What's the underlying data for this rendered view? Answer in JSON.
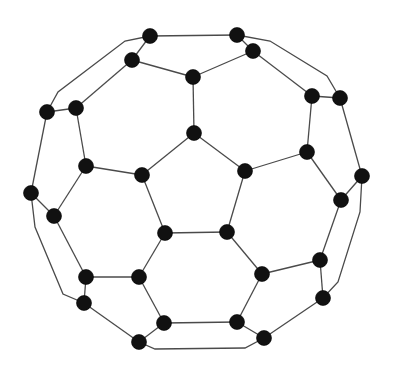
{
  "diagram": {
    "type": "graph",
    "colors": {
      "node": "#111111",
      "edge": "#4a4a4a",
      "background": "#ffffff"
    },
    "node_radius": 7.5,
    "nodes": [
      {
        "id": "n0",
        "x": 150,
        "y": 36
      },
      {
        "id": "n1",
        "x": 237,
        "y": 35
      },
      {
        "id": "n2",
        "x": 132,
        "y": 60
      },
      {
        "id": "n3",
        "x": 253,
        "y": 51
      },
      {
        "id": "n4",
        "x": 193,
        "y": 77
      },
      {
        "id": "n5",
        "x": 47,
        "y": 112
      },
      {
        "id": "n6",
        "x": 76,
        "y": 108
      },
      {
        "id": "n7",
        "x": 312,
        "y": 96
      },
      {
        "id": "n8",
        "x": 340,
        "y": 98
      },
      {
        "id": "n9",
        "x": 194,
        "y": 133
      },
      {
        "id": "n10",
        "x": 86,
        "y": 166
      },
      {
        "id": "n11",
        "x": 142,
        "y": 175
      },
      {
        "id": "n12",
        "x": 245,
        "y": 171
      },
      {
        "id": "n13",
        "x": 307,
        "y": 152
      },
      {
        "id": "n14",
        "x": 31,
        "y": 193
      },
      {
        "id": "n15",
        "x": 54,
        "y": 216
      },
      {
        "id": "n16",
        "x": 362,
        "y": 176
      },
      {
        "id": "n17",
        "x": 341,
        "y": 200
      },
      {
        "id": "n18",
        "x": 165,
        "y": 233
      },
      {
        "id": "n19",
        "x": 227,
        "y": 232
      },
      {
        "id": "n20",
        "x": 320,
        "y": 260
      },
      {
        "id": "n21",
        "x": 86,
        "y": 277
      },
      {
        "id": "n22",
        "x": 139,
        "y": 277
      },
      {
        "id": "n23",
        "x": 262,
        "y": 274
      },
      {
        "id": "n24",
        "x": 84,
        "y": 303
      },
      {
        "id": "n25",
        "x": 323,
        "y": 298
      },
      {
        "id": "n26",
        "x": 164,
        "y": 323
      },
      {
        "id": "n27",
        "x": 237,
        "y": 322
      },
      {
        "id": "n28",
        "x": 139,
        "y": 342
      },
      {
        "id": "n29",
        "x": 264,
        "y": 338
      }
    ],
    "edges": [
      {
        "from": "n0",
        "to": "n1"
      },
      {
        "from": "n0",
        "to": "n2"
      },
      {
        "from": "n1",
        "to": "n3"
      },
      {
        "from": "n2",
        "to": "n4"
      },
      {
        "from": "n3",
        "to": "n4"
      },
      {
        "from": "n4",
        "to": "n9"
      },
      {
        "from": "n2",
        "to": "n6"
      },
      {
        "from": "n5",
        "to": "n6"
      },
      {
        "from": "n6",
        "to": "n10"
      },
      {
        "from": "n3",
        "to": "n7"
      },
      {
        "from": "n7",
        "to": "n8"
      },
      {
        "from": "n7",
        "to": "n13"
      },
      {
        "from": "n9",
        "to": "n11"
      },
      {
        "from": "n9",
        "to": "n12"
      },
      {
        "from": "n11",
        "to": "n18"
      },
      {
        "from": "n12",
        "to": "n19"
      },
      {
        "from": "n18",
        "to": "n19"
      },
      {
        "from": "n10",
        "to": "n11"
      },
      {
        "from": "n12",
        "to": "n13"
      },
      {
        "from": "n10",
        "to": "n15"
      },
      {
        "from": "n13",
        "to": "n17"
      },
      {
        "from": "n5",
        "to": "n14"
      },
      {
        "from": "n14",
        "to": "n15"
      },
      {
        "from": "n8",
        "to": "n16"
      },
      {
        "from": "n16",
        "to": "n17"
      },
      {
        "from": "n15",
        "to": "n21"
      },
      {
        "from": "n17",
        "to": "n20"
      },
      {
        "from": "n18",
        "to": "n22"
      },
      {
        "from": "n19",
        "to": "n23"
      },
      {
        "from": "n21",
        "to": "n22"
      },
      {
        "from": "n23",
        "to": "n20"
      },
      {
        "from": "n21",
        "to": "n24"
      },
      {
        "from": "n20",
        "to": "n25"
      },
      {
        "from": "n22",
        "to": "n26"
      },
      {
        "from": "n23",
        "to": "n27"
      },
      {
        "from": "n26",
        "to": "n27"
      },
      {
        "from": "n24",
        "to": "n28"
      },
      {
        "from": "n26",
        "to": "n28"
      },
      {
        "from": "n27",
        "to": "n29"
      },
      {
        "from": "n25",
        "to": "n29"
      }
    ],
    "outer_paths": [
      {
        "id": "outer-top-left",
        "points": [
          [
            150,
            36
          ],
          [
            125,
            41
          ],
          [
            58,
            92
          ],
          [
            47,
            112
          ]
        ]
      },
      {
        "id": "outer-top-right",
        "points": [
          [
            237,
            35
          ],
          [
            270,
            41
          ],
          [
            327,
            76
          ],
          [
            340,
            98
          ]
        ]
      },
      {
        "id": "outer-left",
        "points": [
          [
            31,
            193
          ],
          [
            35,
            227
          ],
          [
            63,
            294
          ],
          [
            84,
            303
          ]
        ]
      },
      {
        "id": "outer-right",
        "points": [
          [
            362,
            176
          ],
          [
            360,
            212
          ],
          [
            338,
            282
          ],
          [
            323,
            298
          ]
        ]
      },
      {
        "id": "outer-bottom",
        "points": [
          [
            139,
            342
          ],
          [
            155,
            349
          ],
          [
            245,
            348
          ],
          [
            264,
            338
          ]
        ]
      }
    ]
  }
}
